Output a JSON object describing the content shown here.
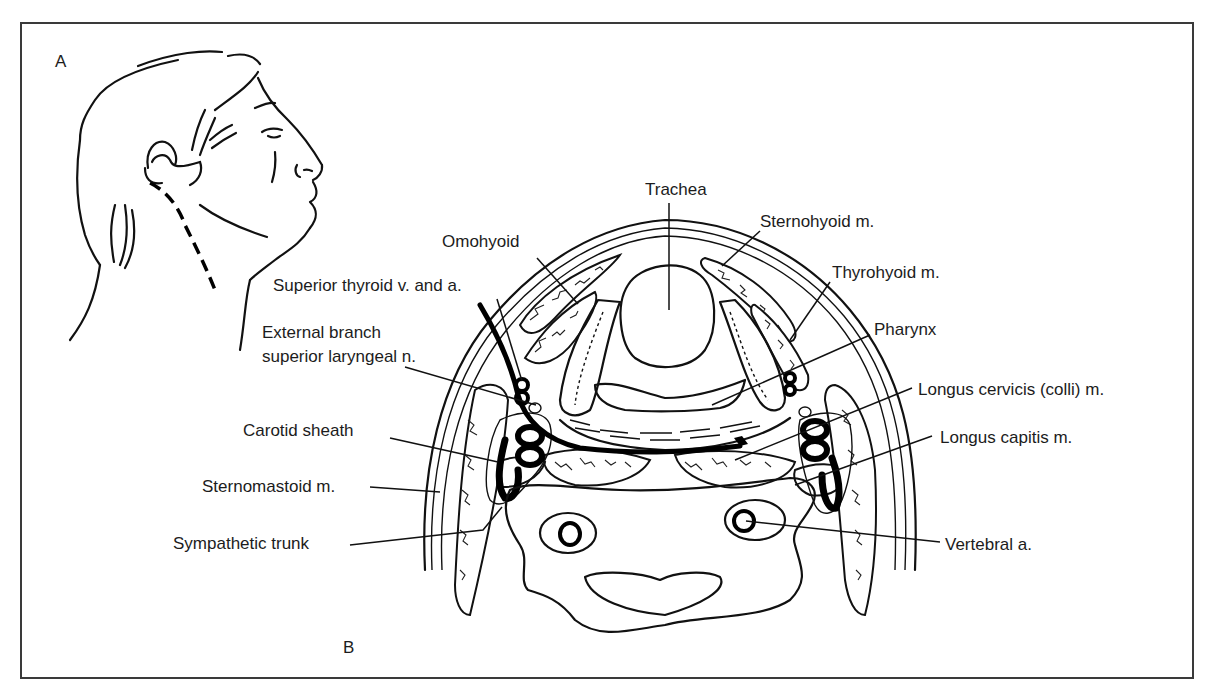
{
  "figure": {
    "panels": {
      "a": "A",
      "b": "B"
    },
    "labels": {
      "trachea": "Trachea",
      "sternohyoid": "Sternohyoid m.",
      "omohyoid": "Omohyoid",
      "thyrohyoid": "Thyrohyoid m.",
      "superior_thyroid": "Superior thyroid v. and a.",
      "external_branch_line1": "External branch",
      "external_branch_line2": "superior laryngeal n.",
      "pharynx": "Pharynx",
      "longus_cervicis": "Longus cervicis (colli) m.",
      "carotid_sheath": "Carotid sheath",
      "longus_capitis": "Longus capitis m.",
      "sternomastoid": "Sternomastoid m.",
      "sympathetic_trunk": "Sympathetic trunk",
      "vertebral_artery": "Vertebral a."
    },
    "panel_a_description": "Side profile of head with dashed incision line along the neck",
    "panel_b_description": "Axial cross-section of the neck showing anterior approach structures"
  }
}
